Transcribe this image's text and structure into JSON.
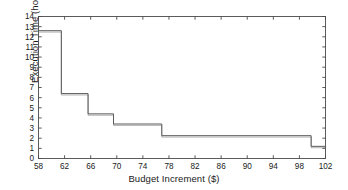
{
  "chart_data": {
    "type": "line",
    "subtype": "step",
    "title": "",
    "xlabel": "Budget Increment ($)",
    "ylabel": "Execution Time (hour)",
    "xlim": [
      58,
      102
    ],
    "ylim": [
      0,
      14
    ],
    "xticks": [
      58,
      62,
      66,
      70,
      74,
      78,
      82,
      86,
      90,
      94,
      98,
      102
    ],
    "yticks": [
      0,
      1,
      2,
      3,
      4,
      5,
      6,
      7,
      8,
      9,
      10,
      11,
      12,
      13,
      14
    ],
    "grid": false,
    "legend": null,
    "series": [
      {
        "name": "Execution Time",
        "color": "#5a5a5a",
        "steps": [
          {
            "x_start": 58.0,
            "x_end": 61.5,
            "y": 12.6
          },
          {
            "x_start": 61.5,
            "x_end": 65.6,
            "y": 6.4
          },
          {
            "x_start": 65.6,
            "x_end": 69.5,
            "y": 4.4
          },
          {
            "x_start": 69.5,
            "x_end": 76.9,
            "y": 3.4
          },
          {
            "x_start": 76.9,
            "x_end": 99.8,
            "y": 2.25
          },
          {
            "x_start": 99.8,
            "x_end": 102.0,
            "y": 1.2
          }
        ]
      }
    ]
  },
  "axis": {
    "x_tick_labels": [
      "58",
      "62",
      "66",
      "70",
      "74",
      "78",
      "82",
      "86",
      "90",
      "94",
      "98",
      "102"
    ],
    "y_tick_labels": [
      "0",
      "1",
      "2",
      "3",
      "4",
      "5",
      "6",
      "7",
      "8",
      "9",
      "10",
      "11",
      "12",
      "13",
      "14"
    ]
  },
  "colors": {
    "line": "#5a5a5a",
    "axis": "#4a4a4a",
    "text": "#1a1a1a",
    "background": "#ffffff"
  }
}
